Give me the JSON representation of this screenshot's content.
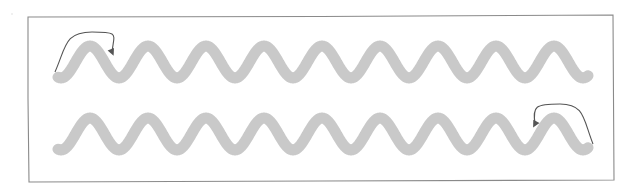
{
  "diagram": {
    "colors": {
      "frame": "#8a8a8a",
      "wave": "#c9c9c9",
      "arrow": "#555555",
      "background": "#ffffff"
    },
    "frame": {
      "x1": 28,
      "y1": 16,
      "x2": 613,
      "y2": 181
    },
    "wave_style": {
      "stroke_width": 11,
      "period": 58,
      "amplitude": 16,
      "peaks_per_row": 9
    },
    "rows": [
      {
        "id": "row-1",
        "start_x": 58,
        "end_x": 588,
        "center_y": 62,
        "arrow": {
          "direction": "left-to-right",
          "start": [
            55,
            72
          ],
          "peak": [
            92,
            32
          ],
          "end": [
            112,
            52
          ]
        }
      },
      {
        "id": "row-2",
        "start_x": 58,
        "end_x": 588,
        "center_y": 134,
        "arrow": {
          "direction": "right-to-left",
          "start": [
            593,
            144
          ],
          "peak": [
            560,
            104
          ],
          "end": [
            535,
            124
          ]
        }
      }
    ]
  }
}
